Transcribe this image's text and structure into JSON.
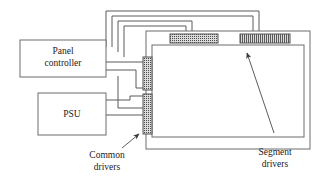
{
  "diagram": {
    "blocks": [
      {
        "id": "panel-controller",
        "label_line1": "Panel",
        "label_line2": "controller"
      },
      {
        "id": "psu",
        "label_line1": "PSU",
        "label_line2": ""
      }
    ],
    "callouts": [
      {
        "id": "common-drivers",
        "label_line1": "Common",
        "label_line2": "drivers"
      },
      {
        "id": "segment-drivers",
        "label_line1": "Segment",
        "label_line2": "drivers"
      }
    ],
    "drivers": {
      "common": [
        {
          "id": "common-driver-upper",
          "orientation": "vertical",
          "pattern": "dots"
        },
        {
          "id": "common-driver-lower",
          "orientation": "vertical",
          "pattern": "dots"
        }
      ],
      "segment": [
        {
          "id": "segment-driver-left",
          "orientation": "horizontal",
          "pattern": "dots"
        },
        {
          "id": "segment-driver-right",
          "orientation": "horizontal",
          "pattern": "stripes"
        }
      ]
    },
    "panel": {
      "id": "display-panel",
      "outer_label": "",
      "inner_label": ""
    },
    "colors": {
      "line": "#5a5a5a",
      "box_stroke": "#6d6d6d",
      "text": "#222222",
      "background": "#ffffff",
      "driver_fill": "#d6d6d6"
    }
  }
}
